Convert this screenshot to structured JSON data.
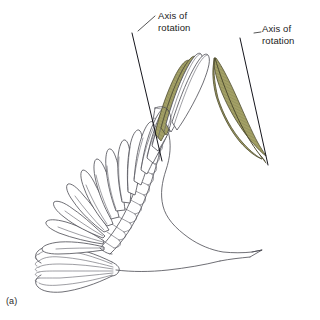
{
  "figure": {
    "panel_label": "(a)",
    "background_color": "#ffffff",
    "ink_color": "#4a4a52",
    "highlight_color": "#a3a066",
    "axis_color": "#15151c"
  },
  "annotations": {
    "wing_axis": {
      "line1": "Axis of",
      "line2": "rotation"
    },
    "feather_axis": {
      "line1": "Axis of",
      "line2": "rotation"
    }
  }
}
